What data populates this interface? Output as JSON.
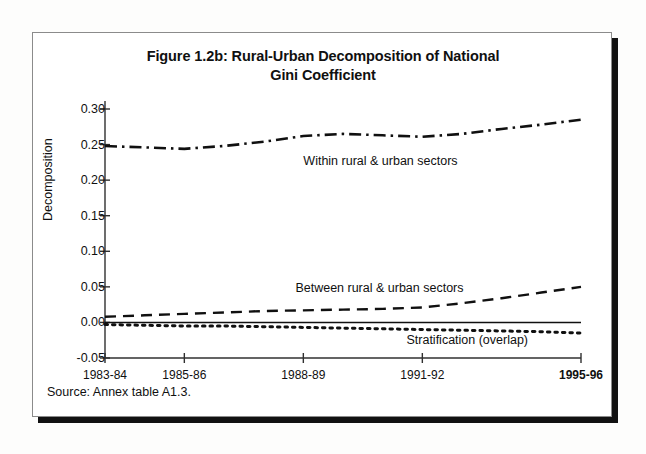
{
  "figure": {
    "title": "Figure 1.2b: Rural-Urban Decomposition of National Gini Coefficient",
    "title_line1": "Figure 1.2b: Rural-Urban Decomposition of National",
    "title_line2": "Gini Coefficient",
    "source_note": "Source: Annex table A1.3."
  },
  "chart_data": {
    "type": "line",
    "title": "Figure 1.2b: Rural-Urban Decomposition of National Gini Coefficient",
    "xlabel": "",
    "ylabel": "Decomposition",
    "ylim": [
      -0.05,
      0.3
    ],
    "ytick_labels": [
      "0.30",
      "0.25",
      "0.20",
      "0.15",
      "0.10",
      "0.05",
      "0.00",
      "-0.05"
    ],
    "ytick_values": [
      0.3,
      0.25,
      0.2,
      0.15,
      0.1,
      0.05,
      0.0,
      -0.05
    ],
    "grid": false,
    "legend_position": "inline-annotations",
    "xtick_labels": [
      "1983-84",
      "1985-86",
      "1988-89",
      "1991-92",
      "1995-96"
    ],
    "xtick_positions": [
      0,
      2,
      5,
      8,
      12
    ],
    "xtick_bold": [
      false,
      false,
      false,
      false,
      true
    ],
    "x": [
      0,
      1,
      2,
      3,
      4,
      5,
      6,
      7,
      8,
      9,
      10,
      11,
      12
    ],
    "x_labels": [
      "1983-84",
      "1984-85",
      "1985-86",
      "1986-87",
      "1987-88",
      "1988-89",
      "1989-90",
      "1990-91",
      "1991-92",
      "1992-93",
      "1993-94",
      "1994-95",
      "1995-96"
    ],
    "series": [
      {
        "name": "Within rural & urban sectors",
        "style": "dash-dot",
        "annotation": "Within rural & urban sectors",
        "values": [
          0.248,
          0.246,
          0.244,
          0.248,
          0.254,
          0.262,
          0.265,
          0.263,
          0.261,
          0.265,
          0.272,
          0.278,
          0.285
        ]
      },
      {
        "name": "Between rural & urban sectors",
        "style": "dashed",
        "annotation": "Between rural & urban sectors",
        "values": [
          0.008,
          0.01,
          0.012,
          0.014,
          0.016,
          0.017,
          0.018,
          0.019,
          0.021,
          0.027,
          0.034,
          0.042,
          0.05
        ]
      },
      {
        "name": "Stratification (overlap)",
        "style": "dotted",
        "annotation": "Stratification (overlap)",
        "values": [
          -0.003,
          -0.004,
          -0.005,
          -0.005,
          -0.006,
          -0.007,
          -0.008,
          -0.009,
          -0.01,
          -0.011,
          -0.012,
          -0.013,
          -0.015
        ]
      },
      {
        "name": "Zero reference line",
        "style": "solid",
        "annotation": "",
        "values": [
          0.0,
          0.0,
          0.0,
          0.0,
          0.0,
          0.0,
          0.0,
          0.0,
          0.0,
          0.0,
          0.0,
          0.0,
          0.0
        ]
      }
    ],
    "annotations": [
      {
        "text": "Within rural & urban sectors",
        "x": 5.0,
        "y": 0.225
      },
      {
        "text": "Between rural & urban sectors",
        "x": 4.8,
        "y": 0.047
      },
      {
        "text": "Stratification (overlap)",
        "x": 7.6,
        "y": -0.026
      }
    ],
    "colors": {
      "line": "#101010",
      "axis": "#303030",
      "background": "#ffffff"
    }
  }
}
